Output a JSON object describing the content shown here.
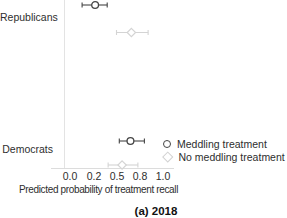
{
  "chart_data": {
    "type": "scatter",
    "subtype": "dot-whisker",
    "title": "",
    "caption": "(a) 2018",
    "xlabel": "Predicted probability of treatment recall",
    "ylabel": "",
    "xlim": [
      0.0,
      1.0
    ],
    "x_ticks": [
      0.0,
      0.25,
      0.5,
      0.75,
      1.0
    ],
    "x_tick_labels": [
      "0.0",
      "0.2",
      "0.5",
      "0.8",
      "1.0"
    ],
    "categories": [
      "Republicans",
      "Democrats"
    ],
    "grid": false,
    "legend_position": "inside-bottom-right",
    "series": [
      {
        "name": "Meddling treatment",
        "marker": "circle",
        "color": "#454545",
        "points": [
          {
            "category": "Republicans",
            "value": 0.27,
            "ci_low": 0.13,
            "ci_high": 0.4
          },
          {
            "category": "Democrats",
            "value": 0.65,
            "ci_low": 0.53,
            "ci_high": 0.8
          }
        ]
      },
      {
        "name": "No meddling treatment",
        "marker": "diamond",
        "color": "#d4d4d4",
        "points": [
          {
            "category": "Republicans",
            "value": 0.66,
            "ci_low": 0.5,
            "ci_high": 0.84
          },
          {
            "category": "Democrats",
            "value": 0.56,
            "ci_low": 0.41,
            "ci_high": 0.73
          }
        ]
      }
    ],
    "layout": {
      "x_origin_px": 70,
      "x_scale_px": 93,
      "cap_half_height_px": 2.5,
      "row_y_px": {
        "Republicans": {
          "Meddling treatment": 5,
          "No meddling treatment": 32.5
        },
        "Democrats": {
          "Meddling treatment": 141,
          "No meddling treatment": 165
        }
      }
    }
  }
}
